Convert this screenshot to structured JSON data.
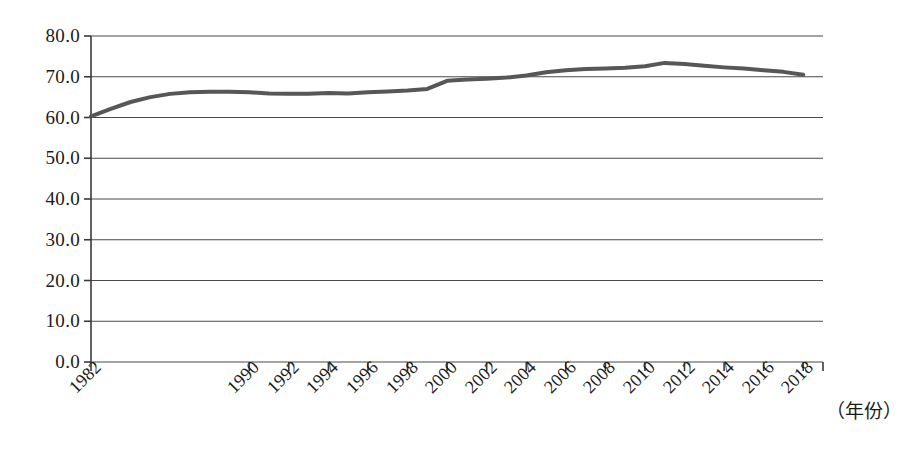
{
  "chart_data": {
    "type": "line",
    "title": "",
    "xlabel": "（年份）",
    "ylabel": "",
    "ylim": [
      0,
      80
    ],
    "ytick_step": 10,
    "ytick_labels": [
      "0.0",
      "10.0",
      "20.0",
      "30.0",
      "40.0",
      "50.0",
      "60.0",
      "70.0",
      "80.0"
    ],
    "ytick_values": [
      0,
      10,
      20,
      30,
      40,
      50,
      60,
      70,
      80
    ],
    "grid": "horizontal",
    "legend": "none",
    "line_color": "#575757",
    "line_width_px": 4,
    "xtick_labels": [
      "1982",
      "1990",
      "1992",
      "1994",
      "1996",
      "1998",
      "2000",
      "2002",
      "2004",
      "2006",
      "2008",
      "2010",
      "2012",
      "2014",
      "2016",
      "2018"
    ],
    "x": [
      1982,
      1983,
      1984,
      1985,
      1986,
      1987,
      1988,
      1989,
      1990,
      1991,
      1992,
      1993,
      1994,
      1995,
      1996,
      1997,
      1998,
      1999,
      2000,
      2001,
      2002,
      2003,
      2004,
      2005,
      2006,
      2007,
      2008,
      2009,
      2010,
      2011,
      2012,
      2013,
      2014,
      2015,
      2016,
      2017,
      2018
    ],
    "values": [
      60.3,
      62.1,
      63.8,
      65.0,
      65.8,
      66.2,
      66.3,
      66.3,
      66.2,
      65.9,
      65.8,
      65.8,
      66.0,
      65.9,
      66.2,
      66.4,
      66.6,
      67.0,
      69.0,
      69.3,
      69.5,
      69.8,
      70.3,
      71.1,
      71.6,
      71.9,
      72.0,
      72.2,
      72.6,
      73.4,
      73.1,
      72.7,
      72.3,
      72.0,
      71.6,
      71.2,
      70.5
    ],
    "x_axis_range": [
      1982,
      2019
    ],
    "series_name": "比重"
  },
  "axis": {
    "x_title": "（年份）"
  },
  "watermark": {
    "line1": "",
    "line2": ""
  }
}
